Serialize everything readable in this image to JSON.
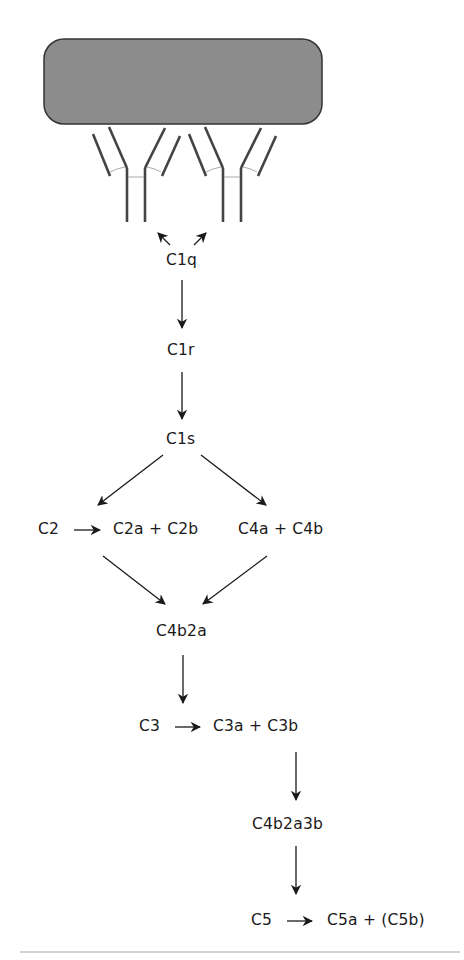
{
  "diagram": {
    "antigen": {
      "label": "",
      "color": "#8c8c8c"
    },
    "nodes": {
      "c1q": "C1q",
      "c1r": "C1r",
      "c1s": "C1s",
      "c2": "C2",
      "c2_split": "C2a + C2b",
      "c4_split": "C4a + C4b",
      "c4b2a": "C4b2a",
      "c3": "C3",
      "c3_split": "C3a + C3b",
      "c4b2a3b": "C4b2a3b",
      "c5": "C5",
      "c5_split": "C5a + (C5b)"
    },
    "edges": [
      [
        "c1q",
        "antibody-1"
      ],
      [
        "c1q",
        "antibody-2"
      ],
      [
        "c1q",
        "c1r"
      ],
      [
        "c1r",
        "c1s"
      ],
      [
        "c1s",
        "c2_split"
      ],
      [
        "c1s",
        "c4_split"
      ],
      [
        "c2",
        "c2_split"
      ],
      [
        "c2_split",
        "c4b2a"
      ],
      [
        "c4_split",
        "c4b2a"
      ],
      [
        "c4b2a",
        "c3"
      ],
      [
        "c3",
        "c3_split"
      ],
      [
        "c3_split",
        "c4b2a3b"
      ],
      [
        "c4b2a3b",
        "c5"
      ],
      [
        "c5",
        "c5_split"
      ]
    ],
    "colors": {
      "line": "#1a1a1a",
      "antibody": "#444444",
      "antigen_fill": "#8c8c8c",
      "rule": "#aaaaaa"
    }
  }
}
